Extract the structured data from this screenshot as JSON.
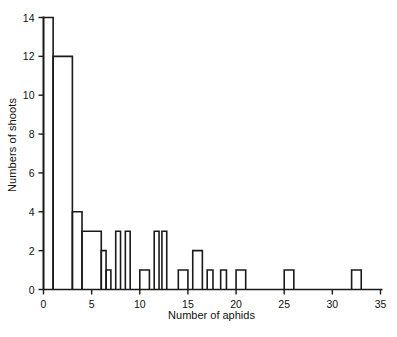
{
  "chart_data": {
    "type": "bar",
    "title": "",
    "xlabel": "Number of aphids",
    "ylabel": "Numbers of shoots",
    "xlim": [
      0,
      35
    ],
    "ylim": [
      0,
      14
    ],
    "xticks": [
      0,
      5,
      10,
      15,
      20,
      25,
      30,
      35
    ],
    "yticks": [
      0,
      2,
      4,
      6,
      8,
      10,
      12,
      14
    ],
    "grid": false,
    "legend": null,
    "style": {
      "line_color": "#1a1a1a",
      "fill_color": "none",
      "background": "#ffffff"
    },
    "bins": [
      {
        "start": 0,
        "end": 1,
        "value": 14
      },
      {
        "start": 1,
        "end": 3,
        "value": 12
      },
      {
        "start": 3,
        "end": 4,
        "value": 4
      },
      {
        "start": 4,
        "end": 6,
        "value": 3
      },
      {
        "start": 6,
        "end": 6.5,
        "value": 2
      },
      {
        "start": 6.5,
        "end": 7,
        "value": 1
      },
      {
        "start": 7.5,
        "end": 8,
        "value": 3
      },
      {
        "start": 8.5,
        "end": 9,
        "value": 3
      },
      {
        "start": 10,
        "end": 11,
        "value": 1
      },
      {
        "start": 11.5,
        "end": 12,
        "value": 3
      },
      {
        "start": 12.3,
        "end": 12.8,
        "value": 3
      },
      {
        "start": 14,
        "end": 15,
        "value": 1
      },
      {
        "start": 15.5,
        "end": 16.5,
        "value": 2
      },
      {
        "start": 17,
        "end": 17.6,
        "value": 1
      },
      {
        "start": 18.4,
        "end": 19,
        "value": 1
      },
      {
        "start": 20,
        "end": 21,
        "value": 1
      },
      {
        "start": 25,
        "end": 26,
        "value": 1
      },
      {
        "start": 32,
        "end": 33,
        "value": 1
      }
    ],
    "categories": [
      "0-1",
      "1-3",
      "3-4",
      "4-6",
      "6-7",
      "7-8",
      "8-9",
      "10-11",
      "11-12",
      "12-13",
      "14-15",
      "15-16",
      "20-21",
      "25-26",
      "32-33"
    ],
    "values": [
      14,
      12,
      4,
      3,
      2,
      1,
      3,
      1,
      3,
      3,
      1,
      2,
      1,
      1,
      1
    ]
  },
  "axes": {
    "x_tick_labels": [
      "0",
      "5",
      "10",
      "15",
      "20",
      "25",
      "30",
      "35"
    ],
    "y_tick_labels": [
      "0",
      "2",
      "4",
      "6",
      "8",
      "10",
      "12",
      "14"
    ],
    "x_axis_title": "Number of aphids",
    "y_axis_title": "Numbers of shoots"
  },
  "caption": {
    "partial_text": ""
  }
}
